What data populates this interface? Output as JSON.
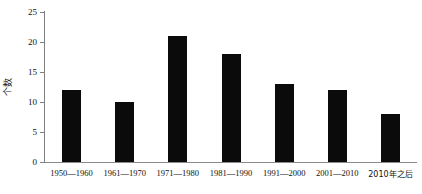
{
  "chart_data": {
    "type": "bar",
    "title": "",
    "xlabel": "",
    "ylabel": "个数",
    "categories": [
      "1950—1960",
      "1961—1970",
      "1971—1980",
      "1981—1990",
      "1991—2000",
      "2001—2010",
      "2010年之后"
    ],
    "values": [
      12,
      10,
      21,
      18,
      13,
      12,
      8
    ],
    "ylim": [
      0,
      25
    ],
    "yticks": [
      0,
      5,
      10,
      15,
      20,
      25
    ],
    "ytick_labels": [
      "0",
      "5",
      "10",
      "15",
      "20",
      "25"
    ],
    "grid": false,
    "legend": null,
    "bar_color": "#0b0b0b",
    "axis_color": "#808080"
  }
}
